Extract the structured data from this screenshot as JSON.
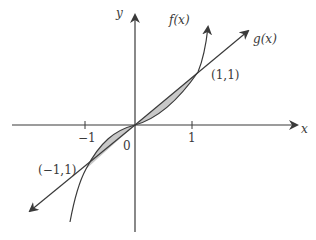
{
  "diagram": {
    "title": "",
    "axes": {
      "x_label": "x",
      "y_label": "y"
    },
    "ticks": {
      "neg_one": "−1",
      "one": "1",
      "origin": "0"
    },
    "curves": {
      "f_label": "f(x)",
      "g_label": "g(x)"
    },
    "points": {
      "p1": "(1,1)",
      "p2": "(−1,1)"
    },
    "colors": {
      "line": "#3a3a3a",
      "shade": "#c8c8c8"
    }
  }
}
